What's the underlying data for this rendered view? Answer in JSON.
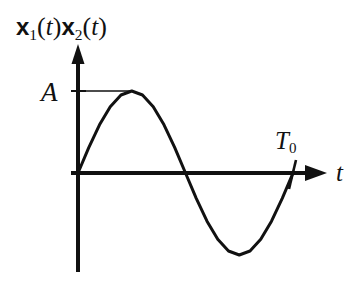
{
  "figure": {
    "background_color": "#ffffff",
    "ink_color": "#111111",
    "width": 364,
    "height": 287
  },
  "labels": {
    "ordinate": {
      "full_text": "x1(t)x2(t)",
      "sym1": "x",
      "sub1": "1",
      "open1": "(",
      "var1": "t",
      "close1": ")",
      "sym2": "x",
      "sub2": "2",
      "open2": "(",
      "var2": "t",
      "close2": ")"
    },
    "amplitude": "A",
    "period_base": "T",
    "period_sub": "0",
    "abscissa": "t"
  },
  "chart_data": {
    "type": "line",
    "title": "",
    "subtitle": "",
    "xlabel": "t",
    "ylabel": "x1(t)x2(t)",
    "grid": false,
    "legend": null,
    "axes": {
      "x_axis_label": "t",
      "y_axis_label": "x1(t)x2(t)",
      "x_tick_labels": [
        "T0"
      ],
      "x_tick_values": [
        1.0
      ],
      "y_tick_labels": [
        "A"
      ],
      "y_tick_values": [
        1.0
      ],
      "xlim": [
        -0.06,
        1.18
      ],
      "ylim": [
        -1.45,
        1.45
      ],
      "x_arrow": true,
      "y_arrow": true
    },
    "annotations": [
      {
        "text": "A",
        "kind": "y-level-line",
        "y": 1.0,
        "x_from": 0.0,
        "x_to": 0.25
      },
      {
        "text": "T0",
        "kind": "x-tick",
        "x": 1.0,
        "y": 0.0
      }
    ],
    "series": [
      {
        "name": "x1(t)x2(t)",
        "expression": "A*sin(2*pi*t/T0)",
        "amplitude": 1.0,
        "period": 1.0,
        "phase": 0.0,
        "color": "#111111",
        "linewidth": 3,
        "x": [
          0.0,
          0.05,
          0.1,
          0.15,
          0.2,
          0.25,
          0.3,
          0.35,
          0.4,
          0.45,
          0.5,
          0.55,
          0.6,
          0.65,
          0.7,
          0.75,
          0.8,
          0.85,
          0.9,
          0.95,
          1.0
        ],
        "values": [
          0.0,
          0.309,
          0.588,
          0.809,
          0.951,
          1.0,
          0.951,
          0.809,
          0.588,
          0.309,
          0.0,
          -0.309,
          -0.588,
          -0.809,
          -0.951,
          -1.0,
          -0.951,
          -0.809,
          -0.588,
          -0.309,
          0.0
        ],
        "key_points": {
          "start_zero": {
            "x": 0.0,
            "y": 0.0
          },
          "peak": {
            "x": 0.25,
            "y": 1.0
          },
          "mid_zero": {
            "x": 0.5,
            "y": 0.0
          },
          "trough": {
            "x": 0.75,
            "y": -1.0
          },
          "end_zero": {
            "x": 1.0,
            "y": 0.0
          }
        }
      }
    ]
  }
}
